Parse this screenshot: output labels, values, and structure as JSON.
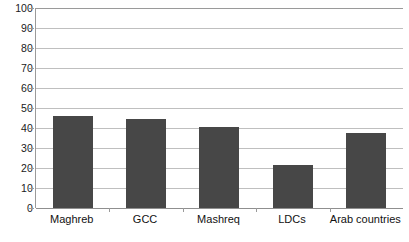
{
  "chart_data": {
    "type": "bar",
    "title": "",
    "subtitle": "",
    "xlabel": "",
    "ylabel": "",
    "categories": [
      "Maghreb",
      "GCC",
      "Mashreq",
      "LDCs",
      "Arab countries"
    ],
    "values": [
      46,
      44.5,
      40.5,
      21.5,
      37.5
    ],
    "ylim": [
      0,
      100
    ],
    "ytick_labels": [
      "0",
      "10",
      "20",
      "30",
      "40",
      "50",
      "60",
      "70",
      "80",
      "90",
      "100"
    ],
    "ytick_values": [
      0,
      10,
      20,
      30,
      40,
      50,
      60,
      70,
      80,
      90,
      100
    ],
    "grid": true,
    "legend": false,
    "legend_position": "none",
    "bar_color": "#474747",
    "gridline_color": "#bfbfbf",
    "axis_color": "#9a9a9a",
    "background_color": "#ffffff"
  }
}
